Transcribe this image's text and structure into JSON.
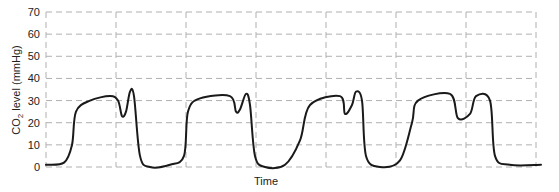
{
  "chart_data": {
    "type": "line",
    "title": "",
    "xlabel": "Time",
    "ylabel": "CO2 level (mmHg)",
    "ylabel_parts": {
      "main": "CO",
      "sub": "2",
      "rest": " level (mmHg)"
    },
    "ylim": [
      0,
      70
    ],
    "yticks": [
      0,
      10,
      20,
      30,
      40,
      50,
      60,
      70
    ],
    "grid": true,
    "x_gridlines": 8,
    "legend": null,
    "series": [
      {
        "name": "CO2 waveform",
        "color": "#1a1a1a",
        "points": [
          [
            0,
            1
          ],
          [
            18,
            2
          ],
          [
            26,
            10
          ],
          [
            30,
            25
          ],
          [
            44,
            30
          ],
          [
            64,
            32
          ],
          [
            72,
            30
          ],
          [
            76,
            23
          ],
          [
            80,
            25
          ],
          [
            84,
            34
          ],
          [
            88,
            32
          ],
          [
            94,
            5
          ],
          [
            104,
            0
          ],
          [
            124,
            1
          ],
          [
            138,
            5
          ],
          [
            142,
            25
          ],
          [
            154,
            31
          ],
          [
            184,
            32
          ],
          [
            190,
            25
          ],
          [
            194,
            26
          ],
          [
            200,
            33
          ],
          [
            204,
            28
          ],
          [
            209,
            5
          ],
          [
            219,
            0
          ],
          [
            239,
            1
          ],
          [
            254,
            12
          ],
          [
            264,
            28
          ],
          [
            294,
            32
          ],
          [
            299,
            24
          ],
          [
            306,
            28
          ],
          [
            310,
            34
          ],
          [
            316,
            30
          ],
          [
            320,
            5
          ],
          [
            334,
            0
          ],
          [
            354,
            3
          ],
          [
            366,
            20
          ],
          [
            372,
            30
          ],
          [
            404,
            33
          ],
          [
            412,
            22
          ],
          [
            424,
            24
          ],
          [
            430,
            32
          ],
          [
            444,
            30
          ],
          [
            449,
            5
          ],
          [
            464,
            1
          ],
          [
            495,
            1
          ]
        ]
      }
    ],
    "x_units": "arbitrary time (0 = left axis, 490 = right gridline)",
    "x_range": [
      0,
      490
    ]
  }
}
